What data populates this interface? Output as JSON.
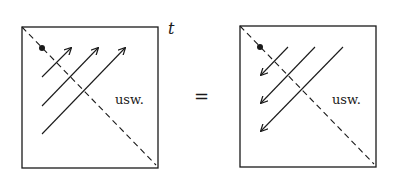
{
  "colors": {
    "ink": "#1a1a1a",
    "background": "#ffffff"
  },
  "left_panel": {
    "label_usw": "usw.",
    "axis_label": "t",
    "arrow_direction": "up-right",
    "arrow_count": 3
  },
  "equals": "=",
  "right_panel": {
    "label_usw": "usw.",
    "arrow_direction": "down-left",
    "arrow_count": 3
  }
}
